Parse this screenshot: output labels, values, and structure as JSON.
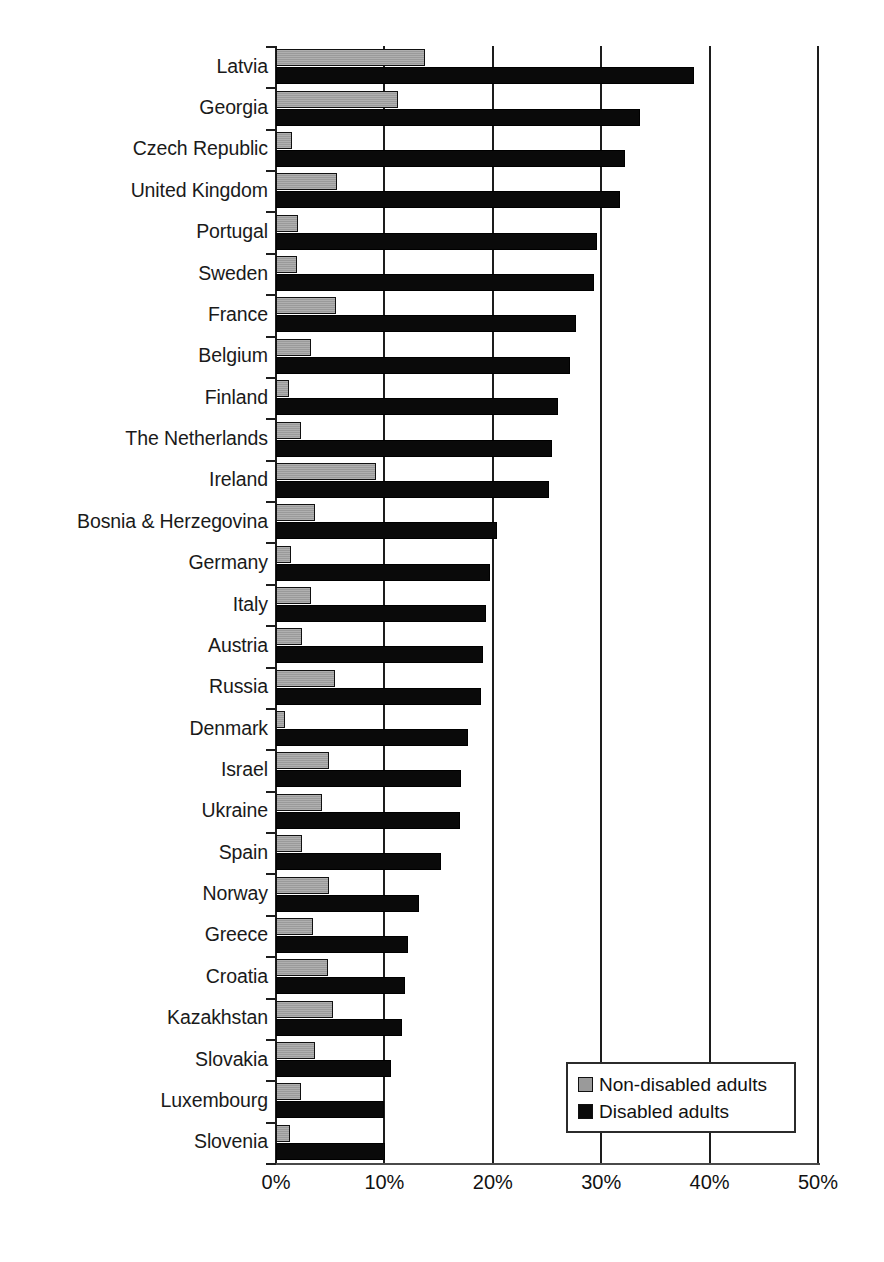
{
  "chart_data": {
    "type": "bar",
    "orientation": "horizontal",
    "title": "",
    "subtitle": "",
    "xlabel": "",
    "ylabel": "",
    "xlim": [
      0,
      50
    ],
    "xtick_labels": [
      "0%",
      "10%",
      "20%",
      "30%",
      "40%",
      "50%"
    ],
    "xtick_values": [
      0,
      10,
      20,
      30,
      40,
      50
    ],
    "grid": "vertical",
    "legend_position": "bottom-right",
    "categories": [
      "Latvia",
      "Georgia",
      "Czech Republic",
      "United Kingdom",
      "Portugal",
      "Sweden",
      "France",
      "Belgium",
      "Finland",
      "The Netherlands",
      "Ireland",
      "Bosnia & Herzegovina",
      "Germany",
      "Italy",
      "Austria",
      "Russia",
      "Denmark",
      "Israel",
      "Ukraine",
      "Spain",
      "Norway",
      "Greece",
      "Croatia",
      "Kazakhstan",
      "Slovakia",
      "Luxembourg",
      "Slovenia"
    ],
    "series": [
      {
        "name": "Non-disabled adults",
        "color": "#9a9a9a",
        "values": [
          13.7,
          11.3,
          1.5,
          5.6,
          2.0,
          1.9,
          5.5,
          3.2,
          1.2,
          2.3,
          9.2,
          3.6,
          1.4,
          3.2,
          2.4,
          5.4,
          0.8,
          4.9,
          4.2,
          2.4,
          4.9,
          3.4,
          4.8,
          5.3,
          3.6,
          2.3,
          1.3
        ]
      },
      {
        "name": "Disabled adults",
        "color": "#0a0a0a",
        "values": [
          38.6,
          33.6,
          32.2,
          31.7,
          29.6,
          29.3,
          27.7,
          27.1,
          26.0,
          25.5,
          25.2,
          20.4,
          19.7,
          19.4,
          19.1,
          18.9,
          17.7,
          17.1,
          17.0,
          15.2,
          13.2,
          12.2,
          11.9,
          11.6,
          10.6,
          10.0,
          10.1
        ]
      }
    ]
  },
  "legend": {
    "items": [
      {
        "label": "Non-disabled adults",
        "swatch": "gray"
      },
      {
        "label": "Disabled adults",
        "swatch": "black"
      }
    ]
  }
}
